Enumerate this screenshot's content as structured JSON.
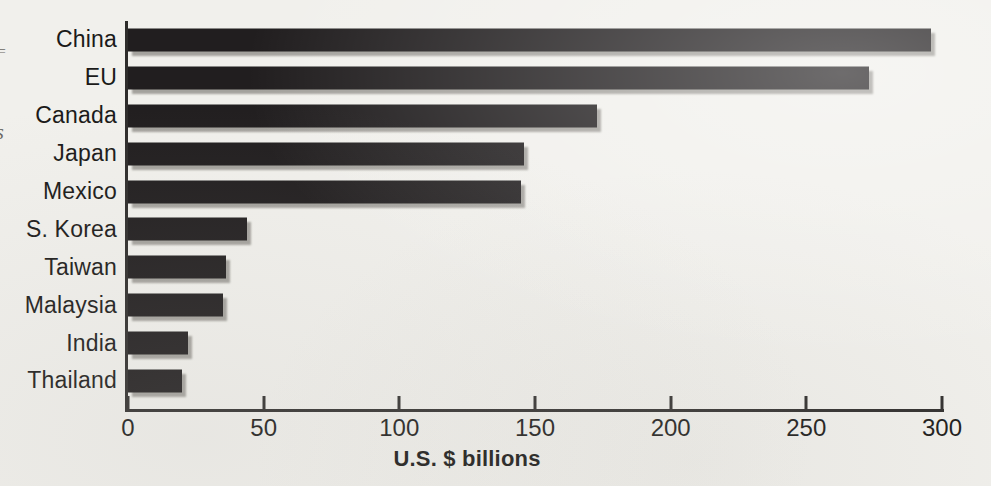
{
  "chart_data": {
    "type": "bar",
    "orientation": "horizontal",
    "title": "",
    "xlabel": "U.S. $ billions",
    "ylabel": "",
    "categories": [
      "China",
      "EU",
      "Canada",
      "Japan",
      "Mexico",
      "S. Korea",
      "Taiwan",
      "Malaysia",
      "India",
      "Thailand"
    ],
    "values": [
      296,
      273,
      173,
      146,
      145,
      44,
      36,
      35,
      22,
      20
    ],
    "xlim": [
      0,
      300
    ],
    "xticks": [
      0,
      50,
      100,
      150,
      200,
      250,
      300
    ],
    "grid": false,
    "legend": null,
    "bar_color": "#211e1f",
    "shadow_color": "#a4a29d",
    "axis_color": "#2e2c2b",
    "background_color": "#f1f0ec"
  },
  "artifacts": {
    "fragment_1": "=",
    "fragment_2": "s"
  }
}
